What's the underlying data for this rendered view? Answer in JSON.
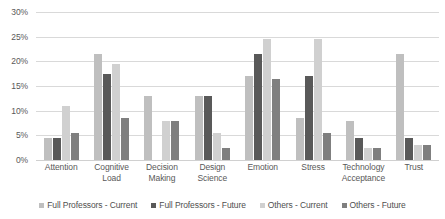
{
  "chart_data": {
    "type": "bar",
    "title": "",
    "subtitle": "",
    "xlabel": "",
    "ylabel": "",
    "ylim": [
      0,
      30
    ],
    "ytick_labels": [
      "0%",
      "5%",
      "10%",
      "15%",
      "20%",
      "25%",
      "30%"
    ],
    "ytick_values": [
      0,
      5,
      10,
      15,
      20,
      25,
      30
    ],
    "grid": true,
    "legend_position": "bottom",
    "value_suffix": "%",
    "categories": [
      "Attention",
      "Cognitive Load",
      "Decision Making",
      "Design Science",
      "Emotion",
      "Stress",
      "Technology Acceptance",
      "Trust"
    ],
    "category_lines": [
      [
        "Attention"
      ],
      [
        "Cognitive",
        "Load"
      ],
      [
        "Decision",
        "Making"
      ],
      [
        "Design",
        "Science"
      ],
      [
        "Emotion"
      ],
      [
        "Stress"
      ],
      [
        "Technology",
        "Acceptance"
      ],
      [
        "Trust"
      ]
    ],
    "series": [
      {
        "name": "Full Professors - Current",
        "color": "#bfbfbf",
        "values": [
          4.5,
          21.5,
          13.0,
          13.0,
          17.0,
          8.5,
          8.0,
          21.5
        ]
      },
      {
        "name": "Full Professors - Future",
        "color": "#595959",
        "values": [
          4.5,
          17.5,
          0.0,
          13.0,
          21.5,
          17.0,
          4.5,
          4.5
        ]
      },
      {
        "name": "Others - Current",
        "color": "#d0d0d0",
        "values": [
          11.0,
          19.5,
          8.0,
          5.5,
          24.5,
          24.5,
          2.5,
          3.0
        ]
      },
      {
        "name": "Others - Future",
        "color": "#7f7f7f",
        "values": [
          5.5,
          8.5,
          8.0,
          2.5,
          16.5,
          5.5,
          2.5,
          3.0
        ]
      }
    ]
  }
}
